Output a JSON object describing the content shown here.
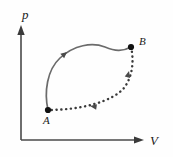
{
  "figure": {
    "kind": "pv-cycle-diagram",
    "background_color": "#fefefe",
    "axes": {
      "vertical_label": "p",
      "horizontal_label": "V",
      "line_color": "#4a4a4a",
      "origin": {
        "x": 21,
        "y": 140
      },
      "vertical_top": {
        "x": 21,
        "y": 27
      },
      "horizontal_right": {
        "x": 143,
        "y": 140
      }
    },
    "states": [
      {
        "id": "A",
        "label": "A",
        "marker": "filled-dot",
        "point": {
          "x": 48,
          "y": 110
        },
        "label_position": {
          "x": 45,
          "y": 123
        },
        "color": "#111111"
      },
      {
        "id": "B",
        "label": "B",
        "marker": "filled-dot",
        "point": {
          "x": 131,
          "y": 47
        },
        "label_position": {
          "x": 140,
          "y": 44
        },
        "color": "#111111"
      }
    ],
    "processes": [
      {
        "id": "A-to-B-solid",
        "style": "solid",
        "color": "#6b6b6b",
        "from": "A",
        "to": "B",
        "direction": "counterclockwise-upper",
        "path": "M 48 110 C 44 92 47 70 60 58 C 74 45 92 42 105 47 C 115 51 122 52 131 47",
        "arrow_at": {
          "x": 66,
          "y": 53
        },
        "arrow_angle_deg": -42
      },
      {
        "id": "B-to-A-dotted",
        "style": "dotted",
        "color": "#3a3a3a",
        "from": "B",
        "to": "A",
        "direction": "back-lower",
        "path": "M 131 47 C 134 60 133 76 124 88 C 112 102 80 110 48 110",
        "arrow_segments": [
          {
            "x": 128,
            "y": 76,
            "angle_deg": -74
          },
          {
            "x": 96,
            "y": 105,
            "angle_deg": 190
          }
        ]
      }
    ]
  }
}
